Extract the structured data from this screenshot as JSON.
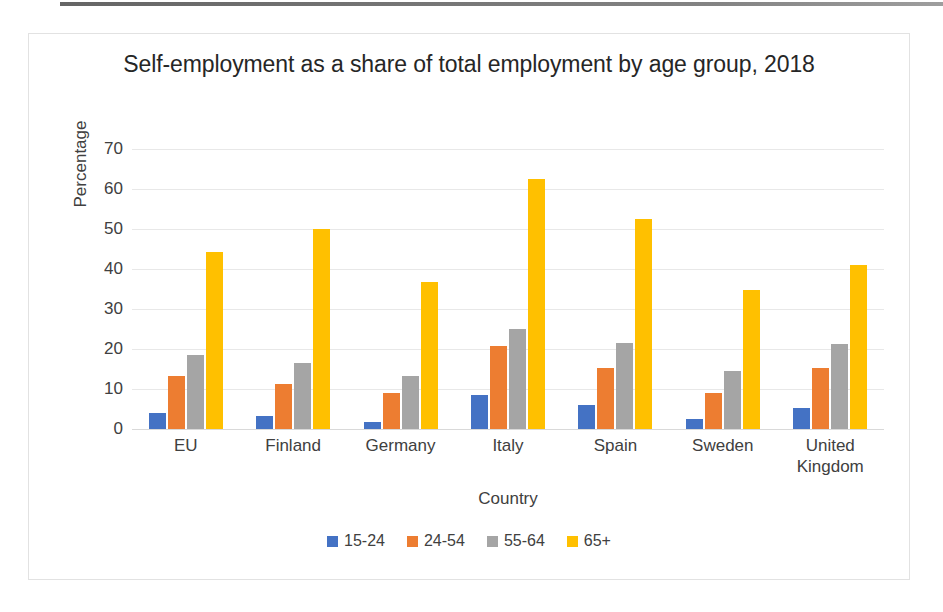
{
  "chart_data": {
    "type": "bar",
    "title": "Self-employment as a share of total employment by age group, 2018",
    "xlabel": "Country",
    "ylabel": "Percentage",
    "ylim": [
      0,
      70
    ],
    "yticks": [
      70,
      60,
      50,
      40,
      30,
      20,
      10,
      0
    ],
    "grid": true,
    "legend_position": "bottom",
    "categories": [
      "EU",
      "Finland",
      "Germany",
      "Italy",
      "Spain",
      "Sweden",
      "United Kingdom"
    ],
    "series": [
      {
        "name": "15-24",
        "color": "#4472C4",
        "values": [
          4.0,
          3.3,
          1.7,
          8.6,
          6.0,
          2.5,
          5.3
        ]
      },
      {
        "name": "24-54",
        "color": "#ED7D31",
        "values": [
          13.3,
          11.2,
          8.9,
          20.8,
          15.3,
          8.9,
          15.3
        ]
      },
      {
        "name": "55-64",
        "color": "#A5A5A5",
        "values": [
          18.6,
          16.6,
          13.3,
          25.1,
          21.5,
          14.4,
          21.2
        ]
      },
      {
        "name": "65+",
        "color": "#FFC000",
        "values": [
          44.2,
          49.9,
          36.7,
          62.4,
          52.5,
          34.8,
          41.0
        ]
      }
    ]
  }
}
